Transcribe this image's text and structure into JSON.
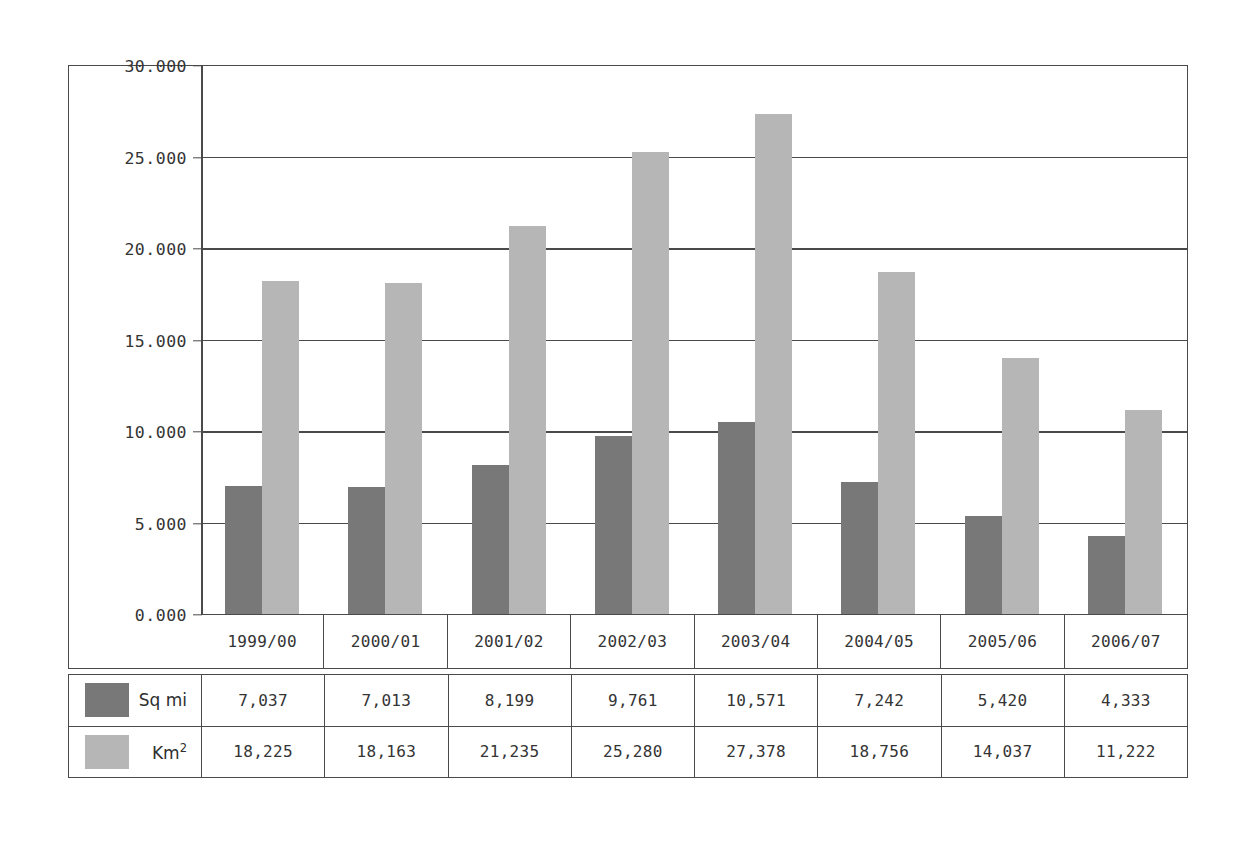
{
  "chart_data": {
    "type": "bar",
    "title": "",
    "xlabel": "",
    "ylabel": "",
    "categories": [
      "1999/00",
      "2000/01",
      "2001/02",
      "2002/03",
      "2003/04",
      "2004/05",
      "2005/06",
      "2006/07"
    ],
    "series": [
      {
        "name": "Sq mi",
        "color": "#787878",
        "values": [
          7037,
          7013,
          8199,
          9761,
          10571,
          7242,
          5420,
          4333
        ],
        "labels": [
          "7,037",
          "7,013",
          "8,199",
          "9,761",
          "10,571",
          "7,242",
          "5,420",
          "4,333"
        ]
      },
      {
        "name": "Km2",
        "name_base": "Km",
        "name_sup": "2",
        "color": "#b6b6b6",
        "values": [
          18225,
          18163,
          21235,
          25280,
          27378,
          18756,
          14037,
          11222
        ],
        "labels": [
          "18,225",
          "18,163",
          "21,235",
          "25,280",
          "27,378",
          "18,756",
          "14,037",
          "11,222"
        ]
      }
    ],
    "ylim": [
      0,
      30000
    ],
    "ytick_values": [
      30000,
      25000,
      20000,
      15000,
      10000,
      5000,
      0
    ],
    "ytick_labels": [
      "30.000",
      "25.000",
      "20.000",
      "15.000",
      "10.000",
      "5.000",
      "0.000"
    ],
    "gridlines": true,
    "legend_position": "table-left"
  },
  "colors": {
    "series_a": "#787878",
    "series_b": "#b6b6b6",
    "frame": "#4a4a4a",
    "background": "#ffffff",
    "text": "#343434"
  }
}
